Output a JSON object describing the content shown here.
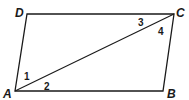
{
  "figure": {
    "shape": "parallelogram",
    "vertices": [
      {
        "name": "A",
        "label": "A",
        "x": 15,
        "y": 91,
        "lx": 3,
        "ly": 98
      },
      {
        "name": "B",
        "label": "B",
        "x": 163,
        "y": 91,
        "lx": 167,
        "ly": 98
      },
      {
        "name": "C",
        "label": "C",
        "x": 174,
        "y": 14,
        "lx": 176,
        "ly": 17
      },
      {
        "name": "D",
        "label": "D",
        "x": 27,
        "y": 14,
        "lx": 15,
        "ly": 17
      }
    ],
    "diagonal": {
      "from": "A",
      "to": "C"
    },
    "angles": [
      {
        "label": "1",
        "x": 24,
        "y": 80
      },
      {
        "label": "2",
        "x": 44,
        "y": 90
      },
      {
        "label": "3",
        "x": 138,
        "y": 26
      },
      {
        "label": "4",
        "x": 158,
        "y": 35
      }
    ],
    "stroke_color": "#1a1a1a"
  }
}
